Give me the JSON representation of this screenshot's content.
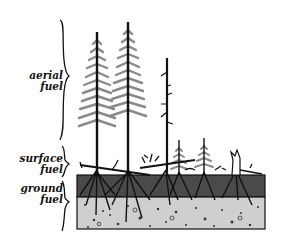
{
  "diagram": {
    "labels": {
      "aerial": [
        "aerial",
        "fuel"
      ],
      "surface": [
        "surface",
        "fuel"
      ],
      "ground": [
        "ground",
        "fuel"
      ]
    },
    "layers": [
      {
        "name": "aerial fuel",
        "y_top": 10,
        "y_bottom": 143
      },
      {
        "name": "surface fuel",
        "y_top": 145,
        "y_bottom": 176
      },
      {
        "name": "ground fuel",
        "y_top": 179,
        "y_bottom": 232
      }
    ],
    "colors": {
      "ink": "#111111",
      "foliage": "#8a8a8a",
      "duff": "#4a4a4a",
      "mineral_soil": "#cfcfcf",
      "background": "#ffffff"
    },
    "elements": [
      "tall conifer 1",
      "tall conifer 2",
      "dead snag",
      "small conifer 1",
      "small conifer 2",
      "broken stump",
      "fallen logs and branches",
      "roots",
      "duff layer",
      "mineral soil with stones"
    ]
  }
}
